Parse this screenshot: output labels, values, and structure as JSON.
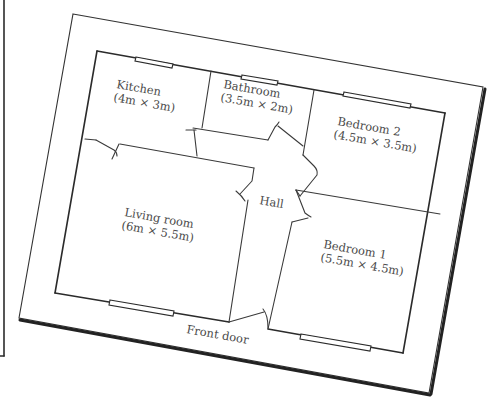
{
  "diagram": {
    "type": "floor-plan",
    "rooms": [
      {
        "id": "kitchen",
        "name": "Kitchen",
        "size": "(4m × 3m)"
      },
      {
        "id": "bathroom",
        "name": "Bathroom",
        "size": "(3.5m × 2m)"
      },
      {
        "id": "bedroom2",
        "name": "Bedroom 2",
        "size": "(4.5m × 3.5m)"
      },
      {
        "id": "living",
        "name": "Living room",
        "size": "(6m × 5.5m)"
      },
      {
        "id": "hall",
        "name": "Hall",
        "size": ""
      },
      {
        "id": "bedroom1",
        "name": "Bedroom 1",
        "size": "(5.5m × 4.5m)"
      }
    ],
    "labels": {
      "front_door": "Front door"
    },
    "colors": {
      "line": "#2b2b2b",
      "text": "#4a4a4a",
      "background": "#ffffff"
    }
  }
}
